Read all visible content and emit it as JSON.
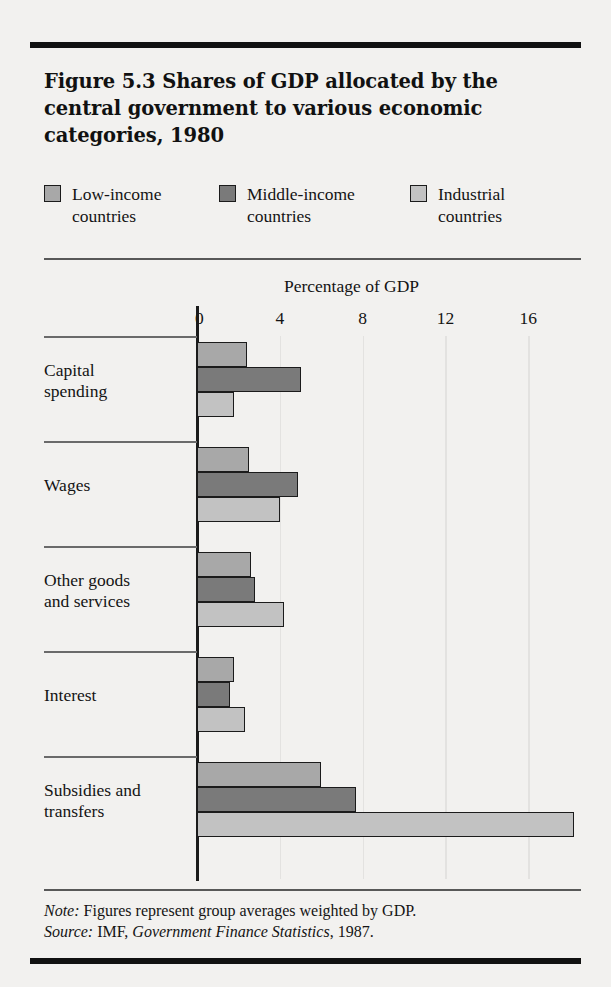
{
  "figure": {
    "title": "Figure 5.3  Shares of GDP allocated by the central government to various economic categories, 1980",
    "note_label": "Note:",
    "note_text": " Figures represent group averages weighted by GDP.",
    "source_label": "Source:",
    "source_text_a": " IMF, ",
    "source_publication": "Government Finance Statistics",
    "source_text_b": ", 1987."
  },
  "legend": {
    "items": [
      {
        "label": "Low-income\ncountries",
        "color": "#a8a8a8"
      },
      {
        "label": "Middle-income\ncountries",
        "color": "#7a7a7a"
      },
      {
        "label": "Industrial\ncountries",
        "color": "#c2c2c2"
      }
    ]
  },
  "chart_data": {
    "type": "bar",
    "orientation": "horizontal",
    "title": "Figure 5.3  Shares of GDP allocated by the central government to various economic categories, 1980",
    "xlabel": "Percentage of GDP",
    "ylabel": "",
    "xlim": [
      0,
      18.5
    ],
    "xticks": [
      0,
      4,
      8,
      12,
      16
    ],
    "xtick_labels": [
      "0",
      "4",
      "8",
      "12",
      "16"
    ],
    "grid": true,
    "legend_position": "top",
    "categories": [
      "Capital\nspending",
      "Wages",
      "Other goods\nand services",
      "Interest",
      "Subsidies and\ntransfers"
    ],
    "series": [
      {
        "name": "Low-income countries",
        "color": "#a8a8a8",
        "values": [
          2.4,
          2.5,
          2.6,
          1.8,
          6.0
        ]
      },
      {
        "name": "Middle-income countries",
        "color": "#7a7a7a",
        "values": [
          5.0,
          4.9,
          2.8,
          1.6,
          7.7
        ]
      },
      {
        "name": "Industrial countries",
        "color": "#c2c2c2",
        "values": [
          1.8,
          4.0,
          4.2,
          2.3,
          18.2
        ]
      }
    ]
  }
}
